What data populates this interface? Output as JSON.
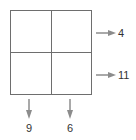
{
  "puzzle": {
    "rows": 2,
    "cols": 2,
    "cells": [
      [
        "",
        ""
      ],
      [
        "",
        ""
      ]
    ],
    "row_sums": [
      "4",
      "11"
    ],
    "col_sums": [
      "9",
      "6"
    ]
  },
  "colors": {
    "grid_line": "#6e6e6e",
    "arrow": "#8c8c8c",
    "label": "#333333"
  }
}
